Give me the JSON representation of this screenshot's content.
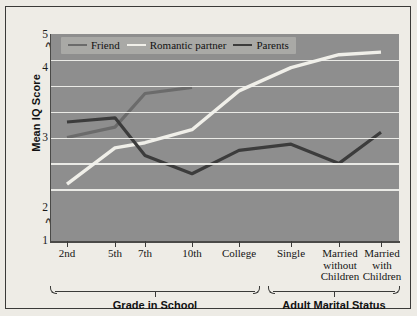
{
  "chart_data": {
    "type": "line",
    "title": "",
    "xlabel": "",
    "ylabel": "Mean IQ Score",
    "ylim": [
      1,
      5
    ],
    "yticks": [
      1,
      2,
      3,
      4,
      5
    ],
    "ytick_labels": [
      "1",
      "2",
      "3",
      "4",
      "5"
    ],
    "y_axis_break": true,
    "gridlines": [
      2,
      2.5,
      3,
      3.5,
      4,
      4.5
    ],
    "grid": true,
    "legend_position": "top-left",
    "categories": [
      "2nd",
      "5th",
      "7th",
      "10th",
      "College",
      "Single",
      "Married without Children",
      "Married with Children"
    ],
    "series": [
      {
        "name": "Friend",
        "color": "#6b6b6b",
        "values": [
          3.0,
          3.2,
          3.85,
          3.97,
          null,
          null,
          null,
          null
        ]
      },
      {
        "name": "Romantic partner",
        "color": "#f0efe9",
        "values": [
          2.1,
          2.8,
          2.9,
          3.15,
          3.9,
          4.35,
          4.6,
          4.65
        ]
      },
      {
        "name": "Parents",
        "color": "#3c3c3c",
        "values": [
          3.3,
          3.38,
          2.65,
          2.3,
          2.75,
          2.87,
          2.5,
          3.1
        ]
      }
    ],
    "groups": [
      {
        "label": "Grade in School",
        "categories": [
          "2nd",
          "5th",
          "7th",
          "10th",
          "College"
        ]
      },
      {
        "label": "Adult Marital Status",
        "categories": [
          "Single",
          "Married without Children",
          "Married with Children"
        ]
      }
    ]
  },
  "axis": {
    "y_title": "Mean IQ Score",
    "y_labels": [
      "5",
      "4",
      "3",
      "2",
      "1"
    ],
    "x_labels": [
      "2nd",
      "5th",
      "7th",
      "10th",
      "College",
      "Single",
      "Married\nwithout\nChildren",
      "Married\nwith\nChildren"
    ]
  },
  "legend": {
    "items": [
      {
        "label": "Friend",
        "color": "#6b6b6b"
      },
      {
        "label": "Romantic partner",
        "color": "#f0efe9"
      },
      {
        "label": "Parents",
        "color": "#3c3c3c"
      }
    ]
  },
  "groups": {
    "school_label": "Grade in School",
    "adult_label": "Adult Marital Status"
  },
  "colors": {
    "plot_background": "#8e8e8e",
    "page_background": "#edebe5",
    "gridline": "#f2f2ee",
    "axis": "#3a3a38",
    "legend_background": "#a9a9a6"
  }
}
